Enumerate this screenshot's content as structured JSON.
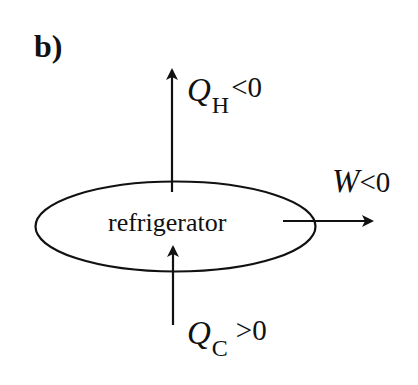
{
  "panel_label": "b)",
  "device": {
    "label": "refrigerator",
    "shape": "ellipse"
  },
  "flows": {
    "heat_hot": {
      "symbol": "Q",
      "subscript": "H",
      "relation": "<0",
      "direction": "up"
    },
    "heat_cold": {
      "symbol": "Q",
      "subscript": "C",
      "relation": ">0",
      "direction": "up"
    },
    "work": {
      "symbol": "W",
      "relation": "<0",
      "direction": "right"
    }
  },
  "colors": {
    "stroke": "#111111",
    "background": "#ffffff"
  }
}
